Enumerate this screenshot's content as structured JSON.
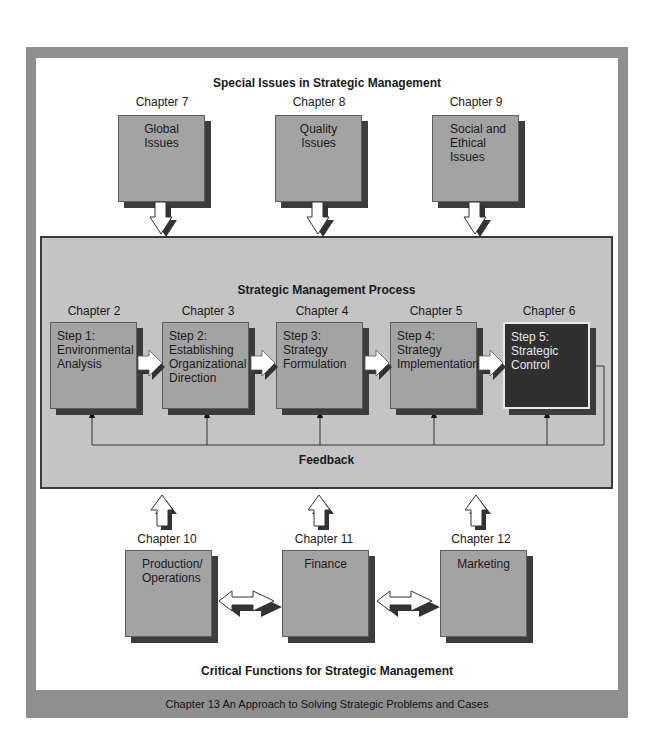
{
  "special_issues": {
    "title": "Special Issues in Strategic Management",
    "items": [
      {
        "chapter": "Chapter 7",
        "label": "Global Issues",
        "lines": [
          "Global",
          "Issues"
        ]
      },
      {
        "chapter": "Chapter 8",
        "label": "Quality Issues",
        "lines": [
          "Quality",
          "Issues"
        ]
      },
      {
        "chapter": "Chapter 9",
        "label": "Social and Ethical Issues",
        "lines": [
          "Social and",
          "Ethical",
          "Issues"
        ]
      }
    ]
  },
  "process": {
    "title": "Strategic Management Process",
    "steps": [
      {
        "chapter": "Chapter 2",
        "lines": [
          "Step 1:",
          "Environmental",
          "Analysis"
        ]
      },
      {
        "chapter": "Chapter 3",
        "lines": [
          "Step 2:",
          "Establishing",
          "Organizational",
          "Direction"
        ]
      },
      {
        "chapter": "Chapter 4",
        "lines": [
          "Step 3:",
          "Strategy",
          "Formulation"
        ]
      },
      {
        "chapter": "Chapter 5",
        "lines": [
          "Step 4:",
          "Strategy",
          "Implementation"
        ]
      },
      {
        "chapter": "Chapter 6",
        "lines": [
          "Step 5:",
          "Strategic",
          "Control"
        ]
      }
    ],
    "feedback_label": "Feedback"
  },
  "critical_functions": {
    "title": "Critical Functions for Strategic Management",
    "items": [
      {
        "chapter": "Chapter 10",
        "lines": [
          "Production/",
          "Operations"
        ]
      },
      {
        "chapter": "Chapter 11",
        "lines": [
          "Finance"
        ]
      },
      {
        "chapter": "Chapter 12",
        "lines": [
          "Marketing"
        ]
      }
    ]
  },
  "footer": "Chapter 13  An Approach to Solving Strategic Problems and Cases",
  "colors": {
    "frame": "#8f8f8f",
    "box_fill": "#a3a3a3",
    "box_shadow": "#3c3c3c",
    "process_fill": "#c4c4c4",
    "highlight_box": "#2f2f2f"
  }
}
